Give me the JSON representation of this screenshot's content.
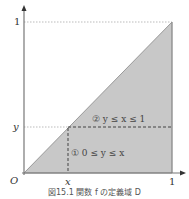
{
  "figure": {
    "caption": "図15.1 関数 f の定義域 D",
    "colors": {
      "region_fill": "#c8c8c8",
      "axis": "#555555",
      "dashed": "#333333",
      "dotted": "#999999"
    },
    "axes": {
      "origin_label": "O",
      "x_tick_var": "x",
      "x_tick_one": "1",
      "y_tick_var": "y",
      "y_tick_one": "1"
    },
    "regions": {
      "region1": "① 0 ≤ y ≤ x",
      "region2": "② y ≤ x ≤ 1"
    }
  }
}
